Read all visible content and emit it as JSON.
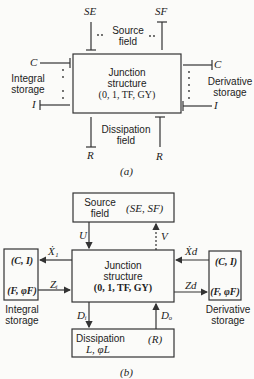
{
  "part_a": {
    "caption": "(a)",
    "sources": {
      "se": "SE",
      "sf": "SF",
      "label_line1": "Source",
      "label_line2": "field"
    },
    "junction": {
      "line1": "Junction",
      "line2": "structure",
      "line3": "(0, 1, TF, GY)"
    },
    "integral": {
      "c": "C",
      "i": "I",
      "label_line1": "Integral",
      "label_line2": "storage"
    },
    "derivative": {
      "c": "C",
      "i": "I",
      "label_line1": "Derivative",
      "label_line2": "storage"
    },
    "dissipation": {
      "r_left": "R",
      "r_right": "R",
      "label_line1": "Dissipation",
      "label_line2": "field"
    }
  },
  "part_b": {
    "caption": "(b)",
    "source": {
      "line1": "Source",
      "line2": "field",
      "elements": "(SE, SF)",
      "u": "U",
      "v": "V"
    },
    "junction": {
      "line1": "Junction",
      "line2": "structure",
      "line3": "(0, 1, TF, GY)"
    },
    "integral": {
      "top": "(C, I)",
      "bottom": "(F, φF)",
      "label_line1": "Integral",
      "label_line2": "storage",
      "x_dot": "Ẋ₁",
      "z": "Zᵢ"
    },
    "derivative": {
      "top": "(C, I)",
      "bottom": "(F, φF)",
      "label_line1": "Derivative",
      "label_line2": "storage",
      "x_dot": "Ẋd",
      "z": "Zd"
    },
    "dissipation": {
      "line1": "Dissipation",
      "line2": "L, φL",
      "r": "(R)",
      "d_in": "Dᵢ",
      "d_out": "Dₒ"
    }
  }
}
